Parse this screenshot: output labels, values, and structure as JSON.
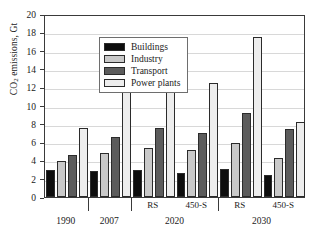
{
  "chart_data": {
    "type": "bar",
    "title": "",
    "xlabel": "",
    "ylabel": "CO2 emissions, Gt",
    "ylabel_parts": {
      "pre": "CO",
      "sub": "2",
      "post": " emissions, Gt"
    },
    "ylim": [
      0,
      20
    ],
    "yticks": [
      0,
      2,
      4,
      6,
      8,
      10,
      12,
      14,
      16,
      18,
      20
    ],
    "ytick_labels": [
      "0",
      "2",
      "4",
      "6",
      "8",
      "10",
      "12",
      "14",
      "16",
      "18",
      "20"
    ],
    "grid": true,
    "grid_axis": "y",
    "legend_position": "upper-left",
    "categories": [
      "1990",
      "2007",
      "RS",
      "450-S",
      "RS",
      "450-S"
    ],
    "group_labels": [
      "1990",
      "2007",
      "2020",
      "2030"
    ],
    "group_spans": [
      1,
      1,
      2,
      2
    ],
    "scenario_labels": [
      "",
      "",
      "RS",
      "450-S",
      "RS",
      "450-S"
    ],
    "series": [
      {
        "name": "Buildings",
        "color": "#0d0d0d",
        "values": [
          2.9,
          2.8,
          3.0,
          2.65,
          3.05,
          2.45
        ]
      },
      {
        "name": "Industry",
        "color": "#c9c9c9",
        "values": [
          3.9,
          4.8,
          5.4,
          5.1,
          5.85,
          4.3
        ]
      },
      {
        "name": "Transport",
        "color": "#5c5c5c",
        "values": [
          4.55,
          6.55,
          7.5,
          6.95,
          9.15,
          7.45
        ]
      },
      {
        "name": "Power plants",
        "color": "#ededed",
        "values": [
          7.5,
          11.8,
          14.7,
          12.45,
          17.5,
          8.25
        ]
      }
    ]
  },
  "legend": {
    "entries": [
      {
        "label": "Buildings"
      },
      {
        "label": "Industry"
      },
      {
        "label": "Transport"
      },
      {
        "label": "Power plants"
      }
    ]
  },
  "colors": {
    "buildings": "#0d0d0d",
    "industry": "#c9c9c9",
    "transport": "#5c5c5c",
    "power_plants": "#ededed",
    "axis": "#3a3a3a",
    "grid": "#d8d8d8",
    "background": "#ffffff"
  }
}
